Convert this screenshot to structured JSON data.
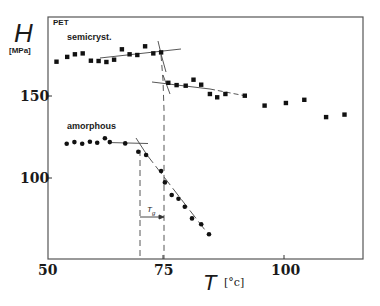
{
  "chart_data": {
    "type": "scatter",
    "title": "PET",
    "xlabel": "T",
    "xunit": "[°c]",
    "ylabel": "H",
    "yunit": "[MPa]",
    "xlim": [
      50,
      115
    ],
    "ylim": [
      50,
      198
    ],
    "xticks": [
      50,
      75,
      100
    ],
    "yticks": [
      100,
      150
    ],
    "grid": false,
    "legend": null,
    "series": [
      {
        "name": "semicryst.",
        "marker": "square",
        "points": [
          [
            53.0,
            171.0
          ],
          [
            55.2,
            173.9
          ],
          [
            56.8,
            175.5
          ],
          [
            58.4,
            176.1
          ],
          [
            60.1,
            171.6
          ],
          [
            61.7,
            171.4
          ],
          [
            63.3,
            170.8
          ],
          [
            64.9,
            172.2
          ],
          [
            66.5,
            178.6
          ],
          [
            68.1,
            175.5
          ],
          [
            69.7,
            175.1
          ],
          [
            71.3,
            180.4
          ],
          [
            73.0,
            176.1
          ],
          [
            74.6,
            176.7
          ],
          [
            76.1,
            158.1
          ],
          [
            77.8,
            156.7
          ],
          [
            79.7,
            156.3
          ],
          [
            81.3,
            160.0
          ],
          [
            82.9,
            156.9
          ],
          [
            84.7,
            151.2
          ],
          [
            86.2,
            149.2
          ],
          [
            87.9,
            151.2
          ],
          [
            91.9,
            150.2
          ],
          [
            96.0,
            144.1
          ],
          [
            100.4,
            145.7
          ],
          [
            104.2,
            147.7
          ],
          [
            108.7,
            137.1
          ],
          [
            112.5,
            138.6
          ]
        ]
      },
      {
        "name": "amorphous",
        "marker": "circle",
        "points": [
          [
            55.1,
            120.8
          ],
          [
            56.7,
            121.8
          ],
          [
            58.3,
            120.8
          ],
          [
            59.9,
            122.0
          ],
          [
            61.4,
            121.4
          ],
          [
            63.0,
            124.1
          ],
          [
            64.0,
            121.8
          ],
          [
            67.2,
            121.0
          ],
          [
            69.9,
            115.9
          ],
          [
            71.5,
            113.9
          ],
          [
            74.6,
            104.1
          ],
          [
            75.4,
            97.1
          ],
          [
            76.8,
            89.4
          ],
          [
            78.2,
            87.1
          ],
          [
            79.5,
            82.2
          ],
          [
            81.0,
            75.1
          ],
          [
            82.9,
            71.5
          ],
          [
            84.5,
            65.4
          ]
        ]
      }
    ],
    "annotations": [
      {
        "text": "PET",
        "type": "label"
      },
      {
        "text": "semicryst.",
        "type": "series-label"
      },
      {
        "text": "amorphous",
        "type": "series-label"
      },
      {
        "text": "Tg",
        "type": "interval-arrow",
        "from": 70,
        "to": 75
      },
      {
        "type": "vline-dashed",
        "x": 70
      },
      {
        "type": "vline-dashed",
        "x": 75
      }
    ]
  },
  "labels": {
    "pet": "PET",
    "semicryst": "semicryst.",
    "amorphous": "amorphous",
    "tg_main": "T",
    "tg_sub": "g",
    "y_symbol": "H",
    "y_unit": "[MPa]",
    "x_symbol": "T",
    "x_unit": "[°c]",
    "xtick_50": "50",
    "xtick_75": "75",
    "xtick_100": "100",
    "ytick_100": "100",
    "ytick_150": "150"
  },
  "colors": {
    "ink": "#1a1a1a",
    "frame": "#555555",
    "background": "#ffffff"
  }
}
